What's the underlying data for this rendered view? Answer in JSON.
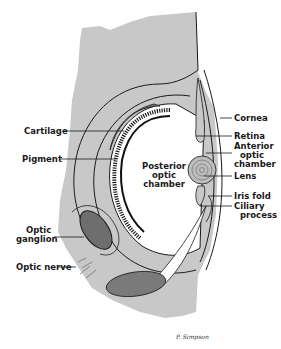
{
  "diagram": {
    "labels": {
      "cornea": "Cornea",
      "retina": "Retina",
      "anterior_chamber_1": "Anterior",
      "anterior_chamber_2": "optic",
      "anterior_chamber_3": "chamber",
      "lens": "Lens",
      "iris_fold": "Iris fold",
      "ciliary_1": "Ciliary",
      "ciliary_2": "process",
      "cartilage": "Cartilage",
      "pigment": "Pigment",
      "posterior_1": "Posterior",
      "posterior_2": "optic",
      "posterior_3": "chamber",
      "optic_ganglion_1": "Optic",
      "optic_ganglion_2": "ganglion",
      "optic_nerve": "Optic nerve"
    },
    "signature": "P. Simpson",
    "colors": {
      "tissue_gray": "#c8c8c8",
      "dark_stipple": "#6e6e6e",
      "line": "#1a1a1a",
      "background": "#ffffff"
    }
  }
}
